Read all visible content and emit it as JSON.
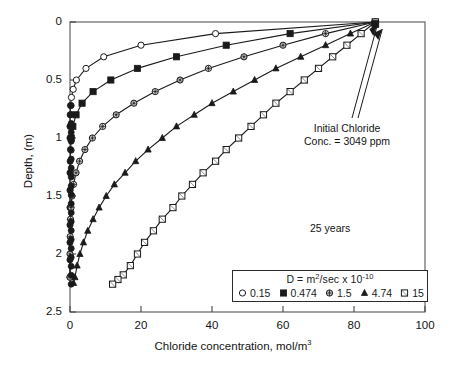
{
  "chart_data": {
    "type": "line",
    "title": "",
    "xlabel": "Chloride concentration, mol/m",
    "xlabel_sup": "3",
    "ylabel": "Depth, (m)",
    "xlim": [
      0,
      100
    ],
    "ylim": [
      0,
      2.5
    ],
    "y_inverted": true,
    "grid": false,
    "xticks": [
      0,
      20,
      40,
      60,
      80,
      100
    ],
    "yticks": [
      0,
      0.5,
      1,
      1.5,
      2,
      2.5
    ],
    "xtick_labels": [
      "0",
      "20",
      "40",
      "60",
      "80",
      "100"
    ],
    "ytick_labels": [
      "0",
      "0.5",
      "1",
      "1.5",
      "2",
      "2.5"
    ],
    "legend_position": "lower-right",
    "legend_title_prefix": "D = ",
    "legend_title_unit": "m",
    "legend_title_unit_sup": "2",
    "legend_title_rest": "/sec x 10",
    "legend_title_exp": "-10",
    "annotations": [
      {
        "name": "initial-chloride",
        "line1": "Initial Chloride",
        "line2": "Conc. = 3049 ppm"
      },
      {
        "name": "time-label",
        "text": "25 years"
      }
    ],
    "converge_point": {
      "x": 86,
      "y": 0
    },
    "series": [
      {
        "name": "0.15",
        "label": "0.15",
        "marker": "open-circle",
        "color": "#1a1a1a",
        "points": [
          [
            86,
            0.0
          ],
          [
            41,
            0.1
          ],
          [
            20,
            0.2
          ],
          [
            9.5,
            0.3
          ],
          [
            4.5,
            0.4
          ],
          [
            1.8,
            0.5
          ],
          [
            0.9,
            0.58
          ],
          [
            0.4,
            0.65
          ],
          [
            0.15,
            0.72
          ],
          [
            0.05,
            0.8
          ],
          [
            0.0,
            0.9
          ],
          [
            0.0,
            1.0
          ]
        ]
      },
      {
        "name": "0.474",
        "label": "0.474",
        "marker": "filled-square",
        "color": "#1a1a1a",
        "points": [
          [
            86,
            0.0
          ],
          [
            62,
            0.1
          ],
          [
            44,
            0.2
          ],
          [
            30,
            0.3
          ],
          [
            19,
            0.4
          ],
          [
            11.5,
            0.5
          ],
          [
            6.5,
            0.6
          ],
          [
            3.4,
            0.7
          ],
          [
            1.7,
            0.8
          ],
          [
            0.8,
            0.9
          ],
          [
            0.35,
            1.0
          ],
          [
            0.15,
            1.1
          ],
          [
            0.05,
            1.2
          ],
          [
            0.0,
            1.3
          ],
          [
            0.0,
            1.45
          ],
          [
            0.0,
            1.6
          ],
          [
            0.0,
            1.75
          ],
          [
            0.0,
            1.9
          ],
          [
            0.0,
            2.05
          ],
          [
            0.0,
            2.2
          ]
        ]
      },
      {
        "name": "1.5",
        "label": "1.5",
        "marker": "crossed-circle",
        "color": "#1a1a1a",
        "points": [
          [
            86,
            0.0
          ],
          [
            72,
            0.1
          ],
          [
            60,
            0.2
          ],
          [
            49,
            0.3
          ],
          [
            39,
            0.4
          ],
          [
            31,
            0.5
          ],
          [
            24,
            0.6
          ],
          [
            18,
            0.7
          ],
          [
            13,
            0.8
          ],
          [
            9.2,
            0.9
          ],
          [
            6.3,
            1.0
          ],
          [
            4.2,
            1.1
          ],
          [
            2.7,
            1.2
          ],
          [
            1.7,
            1.3
          ],
          [
            1.0,
            1.4
          ],
          [
            0.55,
            1.5
          ],
          [
            0.3,
            1.6
          ],
          [
            0.15,
            1.7
          ],
          [
            0.05,
            1.85
          ],
          [
            0.0,
            2.0
          ],
          [
            0.0,
            2.2
          ]
        ]
      },
      {
        "name": "4.74",
        "label": "4.74",
        "marker": "filled-triangle",
        "color": "#1a1a1a",
        "points": [
          [
            86,
            0.0
          ],
          [
            79,
            0.1
          ],
          [
            72,
            0.2
          ],
          [
            65,
            0.3
          ],
          [
            58,
            0.4
          ],
          [
            52,
            0.5
          ],
          [
            46,
            0.6
          ],
          [
            40,
            0.7
          ],
          [
            35,
            0.8
          ],
          [
            30,
            0.9
          ],
          [
            26,
            1.0
          ],
          [
            22,
            1.1
          ],
          [
            18.5,
            1.2
          ],
          [
            15.5,
            1.3
          ],
          [
            12.5,
            1.4
          ],
          [
            10.2,
            1.5
          ],
          [
            8.2,
            1.6
          ],
          [
            6.5,
            1.7
          ],
          [
            5.0,
            1.8
          ],
          [
            3.8,
            1.9
          ],
          [
            2.8,
            2.0
          ],
          [
            2.0,
            2.1
          ],
          [
            1.4,
            2.2
          ],
          [
            1.0,
            2.25
          ]
        ]
      },
      {
        "name": "15",
        "label": "15",
        "marker": "open-square",
        "color": "#1a1a1a",
        "points": [
          [
            86,
            0.0
          ],
          [
            82,
            0.1
          ],
          [
            78,
            0.2
          ],
          [
            74,
            0.3
          ],
          [
            70,
            0.4
          ],
          [
            66,
            0.5
          ],
          [
            62,
            0.6
          ],
          [
            58,
            0.7
          ],
          [
            54.5,
            0.8
          ],
          [
            51,
            0.9
          ],
          [
            47.5,
            1.0
          ],
          [
            44,
            1.1
          ],
          [
            41,
            1.2
          ],
          [
            37.5,
            1.3
          ],
          [
            34.5,
            1.4
          ],
          [
            31.5,
            1.5
          ],
          [
            29,
            1.6
          ],
          [
            26,
            1.7
          ],
          [
            23.5,
            1.8
          ],
          [
            21,
            1.9
          ],
          [
            19,
            2.0
          ],
          [
            17,
            2.1
          ],
          [
            15,
            2.18
          ],
          [
            13.5,
            2.22
          ],
          [
            12,
            2.26
          ]
        ]
      }
    ]
  }
}
